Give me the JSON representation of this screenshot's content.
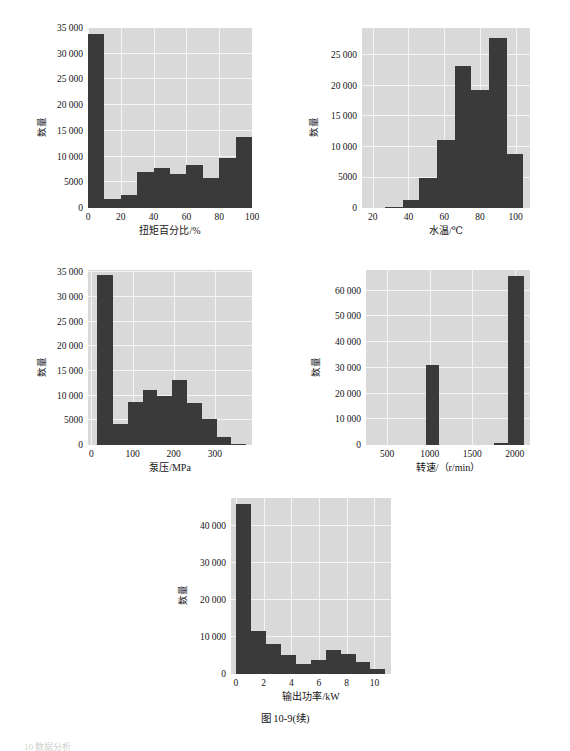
{
  "figure": {
    "caption": "图 10-9(续)",
    "footer_artifact": "10  数据分析",
    "background_color": "#ffffff",
    "plot_background_color": "#d9d9d9",
    "grid_color": "#f4f4f4",
    "bar_color": "#3a3a3a"
  },
  "chart_data": [
    {
      "id": "torque-percent-histogram",
      "type": "bar",
      "title": "",
      "xlabel": "扭矩百分比/%",
      "ylabel": "数量",
      "xlim": [
        0,
        100
      ],
      "ylim": [
        0,
        35000
      ],
      "xticks": [
        0,
        20,
        40,
        60,
        80,
        100
      ],
      "xtick_labels": [
        "0",
        "20",
        "40",
        "60",
        "80",
        "100"
      ],
      "yticks": [
        0,
        5000,
        10000,
        15000,
        20000,
        25000,
        30000,
        35000
      ],
      "ytick_labels": [
        "0",
        "5000",
        "10 000",
        "15 000",
        "20 000",
        "25 000",
        "30 000",
        "35 000"
      ],
      "grid": true,
      "bin_edges": [
        0,
        10,
        20,
        30,
        40,
        50,
        60,
        70,
        80,
        90,
        100
      ],
      "categories": [
        "0-10",
        "10-20",
        "20-30",
        "30-40",
        "40-50",
        "50-60",
        "60-70",
        "70-80",
        "80-90",
        "90-100"
      ],
      "values": [
        33800,
        1800,
        2500,
        7000,
        7800,
        6700,
        8400,
        5900,
        9800,
        13800
      ]
    },
    {
      "id": "water-temperature-histogram",
      "type": "bar",
      "title": "",
      "xlabel": "水温/℃",
      "ylabel": "数量",
      "xlim": [
        14,
        108
      ],
      "ylim": [
        0,
        29500
      ],
      "xticks": [
        20,
        40,
        60,
        80,
        100
      ],
      "xtick_labels": [
        "20",
        "40",
        "60",
        "80",
        "100"
      ],
      "yticks": [
        0,
        5000,
        10000,
        15000,
        20000,
        25000
      ],
      "ytick_labels": [
        "0",
        "5000",
        "10 000",
        "15 000",
        "20 000",
        "25 000"
      ],
      "grid": true,
      "bin_edges": [
        27,
        37,
        46,
        56,
        66,
        75,
        85,
        95,
        104
      ],
      "categories": [
        "27-37",
        "37-46",
        "46-56",
        "56-66",
        "66-75",
        "75-85",
        "85-95",
        "95-104"
      ],
      "values": [
        200,
        1300,
        4900,
        11200,
        23300,
        19400,
        27800,
        8800
      ]
    },
    {
      "id": "pump-pressure-histogram",
      "type": "bar",
      "title": "",
      "xlabel": "泵压/MPa",
      "ylabel": "数量",
      "xlim": [
        -8,
        390
      ],
      "ylim": [
        0,
        35500
      ],
      "xticks": [
        0,
        100,
        200,
        300
      ],
      "xtick_labels": [
        "0",
        "100",
        "200",
        "300"
      ],
      "yticks": [
        0,
        5000,
        10000,
        15000,
        20000,
        25000,
        30000,
        35000
      ],
      "ytick_labels": [
        "0",
        "5000",
        "10 000",
        "15 000",
        "20 000",
        "25 000",
        "30 000",
        "35 000"
      ],
      "grid": true,
      "bin_edges": [
        15,
        53,
        90,
        125,
        160,
        196,
        232,
        268,
        304,
        340,
        375
      ],
      "categories": [
        "15-53",
        "53-90",
        "90-125",
        "125-160",
        "160-196",
        "196-232",
        "232-268",
        "268-304",
        "304-340",
        "340-375"
      ],
      "values": [
        34500,
        4200,
        8800,
        11100,
        9900,
        13100,
        8500,
        5200,
        1700,
        300
      ]
    },
    {
      "id": "rotation-speed-histogram",
      "type": "bar",
      "title": "",
      "xlabel": "转速/（r/min）",
      "ylabel": "数量",
      "xlim": [
        250,
        2180
      ],
      "ylim": [
        0,
        68000
      ],
      "xticks": [
        500,
        1000,
        1500,
        2000
      ],
      "xtick_labels": [
        "500",
        "1000",
        "1500",
        "2000"
      ],
      "yticks": [
        0,
        10000,
        20000,
        30000,
        40000,
        50000,
        60000
      ],
      "ytick_labels": [
        "0",
        "10 000",
        "20 000",
        "30 000",
        "40 000",
        "50 000",
        "60 000"
      ],
      "grid": true,
      "bin_edges": [
        960,
        1110,
        1760,
        1910,
        1920,
        2110
      ],
      "categories": [
        "~1000",
        "~1800",
        "~2000"
      ],
      "bars": [
        {
          "x0": 960,
          "x1": 1110,
          "value": 31000
        },
        {
          "x0": 1760,
          "x1": 1920,
          "value": 800
        },
        {
          "x0": 1920,
          "x1": 2110,
          "value": 65500
        }
      ],
      "values": [
        31000,
        800,
        65500
      ]
    },
    {
      "id": "output-power-histogram",
      "type": "bar",
      "title": "",
      "xlabel": "输出功率/kW",
      "ylabel": "数量",
      "xlim": [
        -0.35,
        11.2
      ],
      "ylim": [
        0,
        47500
      ],
      "xticks": [
        0,
        2,
        4,
        6,
        8,
        10
      ],
      "xtick_labels": [
        "0",
        "2",
        "4",
        "6",
        "8",
        "10"
      ],
      "yticks": [
        0,
        10000,
        20000,
        30000,
        40000
      ],
      "ytick_labels": [
        "0",
        "10 000",
        "20 000",
        "30 000",
        "40 000"
      ],
      "grid": true,
      "bin_edges": [
        0,
        1.08,
        2.16,
        3.24,
        4.32,
        5.4,
        6.48,
        7.56,
        8.64,
        9.72,
        10.8
      ],
      "categories": [
        "0-1.1",
        "1.1-2.2",
        "2.2-3.2",
        "3.2-4.3",
        "4.3-5.4",
        "5.4-6.5",
        "6.5-7.6",
        "7.6-8.6",
        "8.6-9.7",
        "9.7-10.8"
      ],
      "values": [
        45800,
        11500,
        8200,
        5000,
        2800,
        3800,
        6400,
        5500,
        3300,
        1300
      ]
    }
  ]
}
